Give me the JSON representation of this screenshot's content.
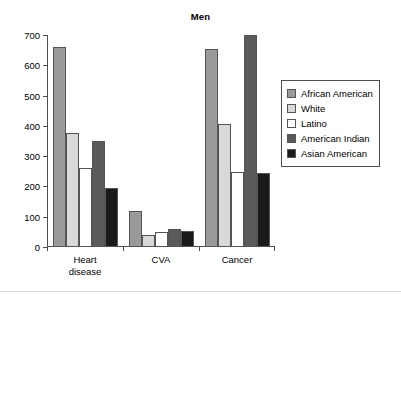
{
  "figure": {
    "background": "#ffffff",
    "axis_color": "#4d4d4d",
    "divider_color": "#dcdcdc"
  },
  "legend": {
    "position": "right",
    "entries": [
      {
        "label": "African American",
        "color": "#9a9a9a"
      },
      {
        "label": "White",
        "color": "#d9d9d9"
      },
      {
        "label": "Latino",
        "color": "#ffffff"
      },
      {
        "label": "American Indian",
        "color": "#5a5a5a"
      },
      {
        "label": "Asian American",
        "color": "#1a1a1a"
      }
    ]
  },
  "chart_data": [
    {
      "type": "bar",
      "title": "Men",
      "xlabel": "",
      "ylabel": "",
      "ylim": [
        0,
        700
      ],
      "yticks": [
        0,
        100,
        200,
        300,
        400,
        500,
        600,
        700
      ],
      "grid": false,
      "categories": [
        "Heart\ndisease",
        "CVA",
        "Cancer"
      ],
      "series": [
        {
          "name": "African American",
          "color": "#9a9a9a",
          "values": [
            660,
            120,
            653
          ]
        },
        {
          "name": "White",
          "color": "#d9d9d9",
          "values": [
            378,
            40,
            405
          ]
        },
        {
          "name": "Latino",
          "color": "#ffffff",
          "values": [
            260,
            48,
            247
          ]
        },
        {
          "name": "American Indian",
          "color": "#5a5a5a",
          "values": [
            351,
            60,
            700
          ]
        },
        {
          "name": "Asian American",
          "color": "#1a1a1a",
          "values": [
            195,
            52,
            243
          ]
        }
      ]
    },
    {
      "type": "bar",
      "title": "Women",
      "xlabel": "",
      "ylabel": "",
      "ylim": [
        250,
        400
      ],
      "yticks": [
        300,
        350,
        400
      ],
      "grid": false,
      "note": "panel is cropped at bottom edge of screenshot",
      "categories": [
        "Heart\ndisease",
        "CVA",
        "Cancer"
      ],
      "series": [
        {
          "name": "African American",
          "color": "#9a9a9a",
          "values": [
            328,
            null,
            388
          ]
        },
        {
          "name": "White",
          "color": "#d9d9d9",
          "values": [
            null,
            null,
            322
          ]
        },
        {
          "name": "Latino",
          "color": "#ffffff",
          "values": [
            null,
            null,
            385
          ]
        },
        {
          "name": "American Indian",
          "color": "#5a5a5a",
          "values": [
            null,
            null,
            null
          ]
        },
        {
          "name": "Asian American",
          "color": "#1a1a1a",
          "values": [
            null,
            null,
            null
          ]
        }
      ]
    }
  ]
}
